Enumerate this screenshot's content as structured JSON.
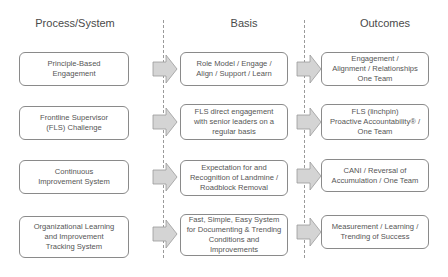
{
  "headers": {
    "process": "Process/System",
    "basis": "Basis",
    "outcomes": "Outcomes"
  },
  "rows": [
    {
      "process": "Principle-Based\nEngagement",
      "basis": "Role Model / Engage /\nAlign / Support / Learn",
      "outcome": "Engagement /\nAlignment / Relationships\nOne Team"
    },
    {
      "process": "Frontline Supervisor\n(FLS) Challenge",
      "basis": "FLS direct engagement\nwith senior leaders on a\nregular basis",
      "outcome": "FLS (linchpin)\nProactive Accountability® /\nOne Team"
    },
    {
      "process": "Continuous\nImprovement System",
      "basis": "Expectation for and\nRecognition of Landmine /\nRoadblock Removal",
      "outcome": "CANI / Reversal of\nAccumulation / One Team"
    },
    {
      "process": "Organizational Learning\nand Improvement\nTracking System",
      "basis": "Fast, Simple, Easy System\nfor Documenting & Trending\nConditions and Improvements",
      "outcome": "Measurement / Learning /\nTrending of Success"
    }
  ],
  "colors": {
    "box_border": "#8a8a8a",
    "arrow_fill": "#d4d4d4",
    "arrow_stroke": "#9a9a9a",
    "divider": "#9a9a9a",
    "text": "#555555"
  }
}
